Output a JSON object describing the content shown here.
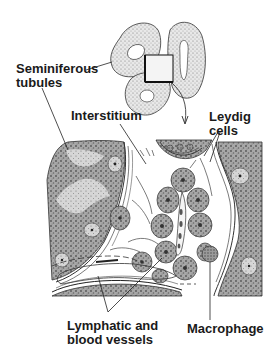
{
  "diagram": {
    "type": "histology-illustration",
    "colors": {
      "ink": "#1a1a1a",
      "stipple": "#6b6b6b",
      "tissue_dark": "#5a5a5a",
      "tissue_mid": "#8f8f8f",
      "tissue_light": "#c4c4c4",
      "background": "#ffffff"
    },
    "labels": {
      "seminiferous_line1": "Seminiferous",
      "seminiferous_line2": "tubules",
      "interstitium": "Interstitium",
      "leydig_line1": "Leydig",
      "leydig_line2": "cells",
      "lymphatic_line1": "Lymphatic and",
      "lymphatic_line2": "blood vessels",
      "macrophage": "Macrophage"
    },
    "inset": {
      "description": "Three coiled tubules with a square box marking the magnified region; curved arrow leads down to the enlarged view"
    }
  }
}
